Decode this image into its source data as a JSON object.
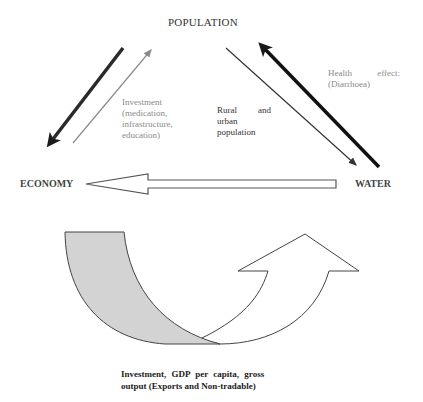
{
  "nodes": {
    "population": "POPULATION",
    "economy": "ECONOMY",
    "water": "WATER"
  },
  "labels": {
    "investment": {
      "lines": [
        "Investment",
        "(medication,",
        "infrastructure,",
        "education)"
      ]
    },
    "rural_urban": {
      "line1_left": "Rural",
      "line1_right": "and",
      "line2": "urban",
      "line3": "population"
    },
    "health_effects": {
      "line1_left": "Health",
      "line1_right": "effect:",
      "line2": "(Diarrhoea)"
    },
    "bottom_caption": {
      "line1": "Investment, GDP per capita, gross",
      "line2": "output (Exports and Non-tradable)"
    }
  },
  "arrows": [
    {
      "from": "POPULATION",
      "to": "ECONOMY",
      "style": "thick-dark"
    },
    {
      "from": "ECONOMY",
      "to": "POPULATION",
      "style": "thin-gray",
      "label": "Investment"
    },
    {
      "from": "POPULATION",
      "to": "WATER",
      "style": "thin-dark",
      "label": "Rural and urban population"
    },
    {
      "from": "WATER",
      "to": "POPULATION",
      "style": "thick-black",
      "label": "Health effects"
    },
    {
      "from": "WATER",
      "to": "ECONOMY",
      "style": "block-outline"
    },
    {
      "from": "ECONOMY",
      "to": "upward",
      "style": "curved-u-turn",
      "label": "Investment, GDP per capita, gross output"
    }
  ],
  "colors": {
    "curved_fill": "#d3d3d3",
    "thick_arrow": "#1a1a1a",
    "thin_gray": "#8a8a8a",
    "outline": "#555555"
  }
}
